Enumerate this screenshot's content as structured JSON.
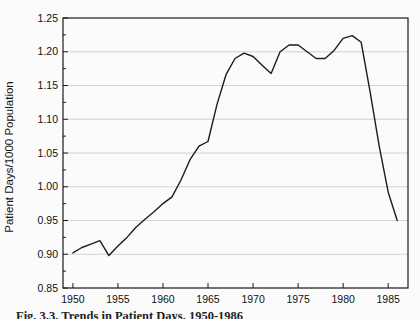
{
  "caption": "Fig. 3.3. Trends in Patient Days, 1950-1986",
  "chart_data": {
    "type": "line",
    "title": "",
    "xlabel": "",
    "ylabel": "Patient Days/1000 Population",
    "xlim": [
      1948.9,
      1987.2
    ],
    "ylim": [
      0.85,
      1.25
    ],
    "x_ticks": [
      1950,
      1955,
      1960,
      1965,
      1970,
      1975,
      1980,
      1985
    ],
    "y_ticks": [
      0.85,
      0.9,
      0.95,
      1.0,
      1.05,
      1.1,
      1.15,
      1.2,
      1.25
    ],
    "grid": true,
    "legend": "none",
    "line_color": "#1c1c1c",
    "grid_color": "#c9c9c9",
    "frame_color": "#1a1a1a",
    "x": [
      1950,
      1951,
      1952,
      1953,
      1954,
      1955,
      1956,
      1957,
      1958,
      1959,
      1960,
      1961,
      1962,
      1963,
      1964,
      1965,
      1966,
      1967,
      1968,
      1969,
      1970,
      1971,
      1972,
      1973,
      1974,
      1975,
      1976,
      1977,
      1978,
      1979,
      1980,
      1981,
      1982,
      1983,
      1984,
      1985,
      1986
    ],
    "series": [
      {
        "name": "Patient Days per 1000 Population",
        "values": [
          0.902,
          0.91,
          0.915,
          0.92,
          0.898,
          0.912,
          0.925,
          0.94,
          0.952,
          0.963,
          0.975,
          0.985,
          1.01,
          1.04,
          1.06,
          1.067,
          1.122,
          1.166,
          1.19,
          1.198,
          1.193,
          1.18,
          1.168,
          1.2,
          1.21,
          1.21,
          1.2,
          1.19,
          1.19,
          1.202,
          1.22,
          1.224,
          1.214,
          1.14,
          1.06,
          0.992,
          0.95
        ]
      }
    ]
  }
}
